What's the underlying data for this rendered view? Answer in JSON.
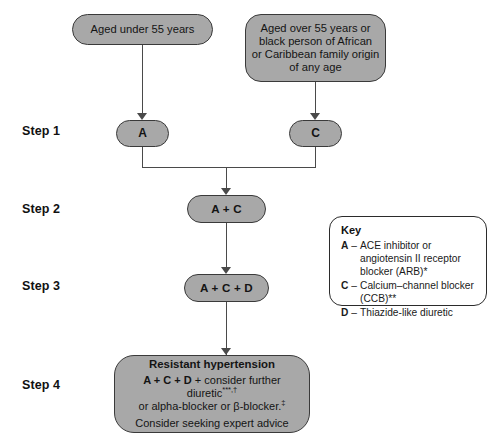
{
  "diagram": {
    "colors": {
      "node_fill": "#a8a8a8",
      "node_border": "#3a3a3a",
      "connector": "#4a4a4a",
      "background": "#ffffff",
      "key_border": "#2b2b2b"
    }
  },
  "steps": {
    "step1": "Step 1",
    "step2": "Step 2",
    "step3": "Step 3",
    "step4": "Step 4"
  },
  "nodes": {
    "criteria_left": {
      "lines": [
        "Aged under 55 years"
      ]
    },
    "criteria_right": {
      "lines": [
        "Aged over 55 years or",
        "black person of African",
        "or Caribbean family origin",
        "of any age"
      ]
    },
    "drug_a": "A",
    "drug_c": "C",
    "step2_combo": "A + C",
    "step3_combo": "A + C + D",
    "step4": {
      "title": "Resistant hypertension",
      "line2_bold": "A + C + D",
      "line2_rest": " + consider further diuretic",
      "line2_sup": "***,†",
      "line3": "or alpha-blocker or β-blocker.",
      "line3_sup": "‡",
      "line4": "Consider seeking expert advice"
    }
  },
  "key": {
    "title": "Key",
    "items": [
      {
        "letter": "A",
        "dash": "–",
        "text": "ACE inhibitor or angiotensin II receptor blocker (ARB)*"
      },
      {
        "letter": "C",
        "dash": "–",
        "text": "Calcium–channel blocker (CCB)**"
      },
      {
        "letter": "D",
        "dash": "–",
        "text": "Thiazide-like diuretic"
      }
    ]
  }
}
